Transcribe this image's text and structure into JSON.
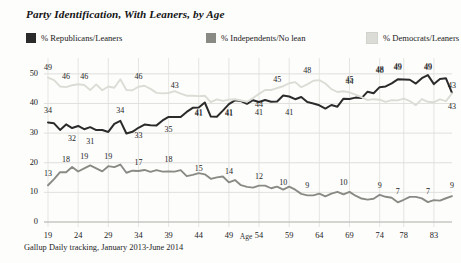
{
  "header": {
    "title": "Party Identification, With Leaners, by Age"
  },
  "legend": [
    {
      "label": "% Republicans/Leaners",
      "color": "#2b2b2b",
      "key": "republicans"
    },
    {
      "label": "% Independents/No lean",
      "color": "#8a8a85",
      "key": "independents"
    },
    {
      "label": "% Democrats/Leaners",
      "color": "#dcdcd6",
      "key": "democrats"
    }
  ],
  "source": "Gallup Daily tracking, January 2013-June 2014",
  "axis": {
    "x_title": "Age",
    "y_ticks": [
      "0",
      "10",
      "20",
      "30",
      "40",
      "50"
    ],
    "x_ticks": [
      "19",
      "24",
      "29",
      "34",
      "39",
      "44",
      "49",
      "54",
      "59",
      "64",
      "69",
      "74",
      "78",
      "83"
    ]
  },
  "chart_data": {
    "type": "line",
    "title": "Party Identification, With Leaners, by Age",
    "subtitle": "",
    "xlabel": "Age",
    "ylabel": "",
    "xlim": [
      19,
      86
    ],
    "ylim": [
      0,
      54
    ],
    "grid": true,
    "legend_position": "top",
    "x": [
      19,
      20,
      21,
      22,
      23,
      24,
      25,
      26,
      27,
      28,
      29,
      30,
      31,
      32,
      33,
      34,
      35,
      36,
      37,
      38,
      39,
      40,
      41,
      42,
      43,
      44,
      45,
      46,
      47,
      48,
      49,
      50,
      51,
      52,
      53,
      54,
      55,
      56,
      57,
      58,
      59,
      60,
      61,
      62,
      63,
      64,
      65,
      66,
      67,
      68,
      69,
      70,
      71,
      72,
      73,
      74,
      75,
      76,
      77,
      78,
      79,
      80,
      81,
      82,
      83,
      84,
      85,
      86
    ],
    "series": [
      {
        "name": "% Republicans/Leaners",
        "color": "#2b2b2b",
        "values": [
          34,
          33,
          31,
          33,
          32,
          32,
          31,
          32,
          31,
          31,
          31,
          33,
          34,
          30,
          30,
          32,
          33,
          33,
          32,
          34,
          35,
          35,
          36,
          37,
          38,
          39,
          40,
          36,
          35,
          38,
          40,
          41,
          41,
          40,
          41,
          41,
          41,
          40,
          41,
          43,
          42,
          41,
          42,
          41,
          40,
          39,
          38,
          40,
          39,
          41,
          41,
          42,
          42,
          44,
          44,
          45,
          46,
          47,
          48,
          48,
          48,
          47,
          48,
          49,
          47,
          48,
          49,
          43
        ],
        "labels": [
          {
            "x": 19,
            "value": "34"
          },
          {
            "x": 23,
            "value": "32"
          },
          {
            "x": 26,
            "value": "31"
          },
          {
            "x": 31,
            "value": "34"
          },
          {
            "x": 34,
            "value": "33"
          },
          {
            "x": 39,
            "value": "35"
          },
          {
            "x": 44,
            "value": "41"
          },
          {
            "x": 49,
            "value": "41"
          },
          {
            "x": 54,
            "value": "41"
          },
          {
            "x": 59,
            "value": "41"
          },
          {
            "x": 69,
            "value": "44"
          },
          {
            "x": 74,
            "value": "48"
          },
          {
            "x": 77,
            "value": "49"
          },
          {
            "x": 82,
            "value": "49"
          },
          {
            "x": 86,
            "value": "43"
          }
        ]
      },
      {
        "name": "% Independents/No lean",
        "color": "#8a8a85",
        "values": [
          13,
          15,
          17,
          17,
          18,
          17,
          18,
          19,
          18,
          17,
          19,
          18,
          19,
          17,
          17,
          17,
          17,
          17,
          17,
          17,
          17,
          17,
          18,
          16,
          16,
          16,
          16,
          15,
          15,
          15,
          14,
          14,
          13,
          12,
          12,
          12,
          12,
          11,
          12,
          11,
          12,
          11,
          10,
          9,
          9,
          9,
          9,
          9,
          10,
          9,
          10,
          9,
          8,
          8,
          8,
          9,
          8,
          8,
          7,
          7,
          8,
          8,
          8,
          7,
          7,
          7,
          8,
          9
        ],
        "labels": [
          {
            "x": 19,
            "value": "13"
          },
          {
            "x": 22,
            "value": "18"
          },
          {
            "x": 25,
            "value": "19"
          },
          {
            "x": 29,
            "value": "19"
          },
          {
            "x": 34,
            "value": "17"
          },
          {
            "x": 39,
            "value": "18"
          },
          {
            "x": 44,
            "value": "15"
          },
          {
            "x": 49,
            "value": "14"
          },
          {
            "x": 54,
            "value": "12"
          },
          {
            "x": 58,
            "value": "10"
          },
          {
            "x": 62,
            "value": "9"
          },
          {
            "x": 68,
            "value": "10"
          },
          {
            "x": 74,
            "value": "9"
          },
          {
            "x": 77,
            "value": "7"
          },
          {
            "x": 82,
            "value": "7"
          },
          {
            "x": 86,
            "value": "9"
          }
        ]
      },
      {
        "name": "% Democrats/Leaners",
        "color": "#dcdcd6",
        "values": [
          49,
          48,
          46,
          45,
          46,
          46,
          46,
          45,
          46,
          45,
          46,
          45,
          48,
          45,
          45,
          46,
          46,
          45,
          44,
          44,
          44,
          44,
          43,
          43,
          43,
          43,
          42,
          41,
          41,
          41,
          41,
          41,
          41,
          41,
          42,
          43,
          44,
          45,
          45,
          46,
          47,
          47,
          46,
          47,
          48,
          48,
          47,
          45,
          44,
          44,
          44,
          43,
          42,
          41,
          41,
          41,
          41,
          41,
          41,
          41,
          41,
          40,
          41,
          40,
          40,
          41,
          41,
          43
        ],
        "labels": [
          {
            "x": 19,
            "value": "49"
          },
          {
            "x": 22,
            "value": "46"
          },
          {
            "x": 25,
            "value": "46"
          },
          {
            "x": 34,
            "value": "46"
          },
          {
            "x": 40,
            "value": "43"
          },
          {
            "x": 44,
            "value": "41"
          },
          {
            "x": 49,
            "value": "41"
          },
          {
            "x": 54,
            "value": "44"
          },
          {
            "x": 57,
            "value": "45"
          },
          {
            "x": 62,
            "value": "48"
          },
          {
            "x": 69,
            "value": "45"
          },
          {
            "x": 74,
            "value": "48"
          },
          {
            "x": 77,
            "value": "49"
          },
          {
            "x": 82,
            "value": "49"
          },
          {
            "x": 86,
            "value": "43"
          }
        ]
      }
    ]
  }
}
